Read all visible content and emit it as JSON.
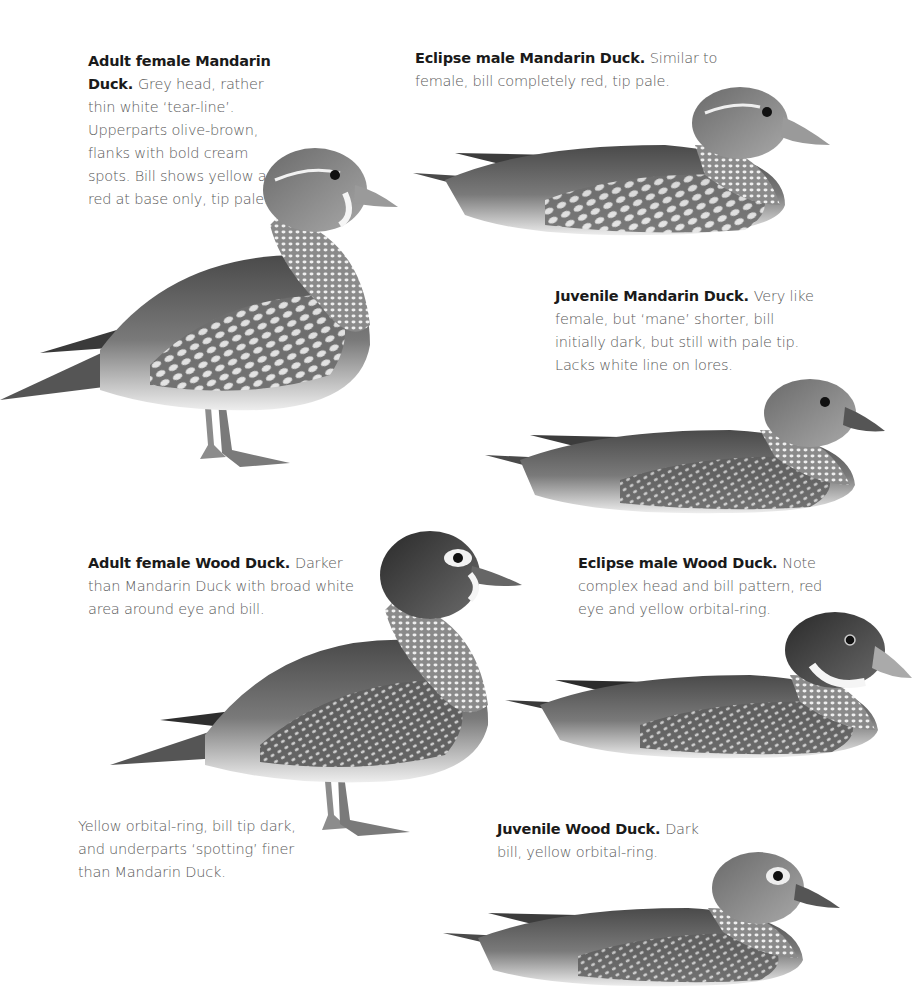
{
  "plate": {
    "entries": [
      {
        "id": "adult-female-mandarin",
        "title": "Adult female Mandarin Duck.",
        "text": "Grey head, rather thin white ‘tear-line’. Upperparts olive-brown, flanks with bold cream spots. Bill shows yellow and red at base only, tip pale.",
        "pose": "standing"
      },
      {
        "id": "eclipse-male-mandarin",
        "title": "Eclipse male Mandarin Duck.",
        "text": "Similar to female, bill completely red, tip pale.",
        "pose": "swimming"
      },
      {
        "id": "juvenile-mandarin",
        "title": "Juvenile Mandarin Duck.",
        "text": "Very like female, but ‘mane’ shorter, bill initially dark, but still with pale tip. Lacks white line on lores.",
        "pose": "swimming"
      },
      {
        "id": "adult-female-wood",
        "title": "Adult female Wood Duck.",
        "text": "Darker than Mandarin Duck with broad white area around eye and bill.",
        "extra_text": "Yellow orbital-ring, bill tip dark, and underparts ‘spotting’ finer than Mandarin Duck.",
        "pose": "standing"
      },
      {
        "id": "eclipse-male-wood",
        "title": "Eclipse male Wood Duck.",
        "text": "Note complex head and bill pattern, red eye and yellow orbital-ring.",
        "pose": "swimming"
      },
      {
        "id": "juvenile-wood",
        "title": "Juvenile Wood Duck.",
        "text": "Dark bill, yellow orbital-ring.",
        "pose": "swimming"
      }
    ]
  }
}
